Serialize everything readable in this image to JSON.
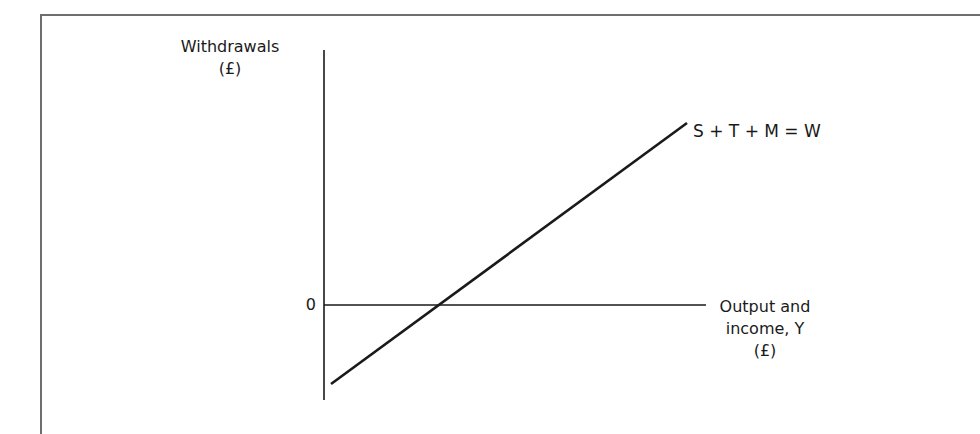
{
  "diagram": {
    "type": "withdrawals-function",
    "y_axis": {
      "label_line1": "Withdrawals",
      "label_line2": "(£)"
    },
    "x_axis": {
      "label_line1": "Output and",
      "label_line2": "income, Y",
      "label_line3": "(£)"
    },
    "origin_label": "0",
    "curve": {
      "label": "S + T + M = W",
      "start": [
        331,
        384
      ],
      "end": [
        687,
        123
      ],
      "x_intercept": [
        439,
        305
      ]
    },
    "colors": {
      "line": "#1a1a1a",
      "frame": "#6e6e6e",
      "background": "#ffffff"
    }
  }
}
